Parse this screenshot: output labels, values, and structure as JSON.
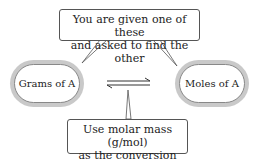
{
  "top_callout": {
    "line1": "You are given one of these",
    "line2": "and asked to find the other"
  },
  "left_node": {
    "label": "Grams of A"
  },
  "right_node": {
    "label": "Moles of A"
  },
  "bottom_callout": {
    "line1": "Use molar mass (g/mol)",
    "line2": "as the conversion factor"
  },
  "arrow": {
    "type": "equilibrium-arrows"
  },
  "colors": {
    "ring": "#c9c9c9",
    "border": "#555555",
    "text": "#222222"
  }
}
